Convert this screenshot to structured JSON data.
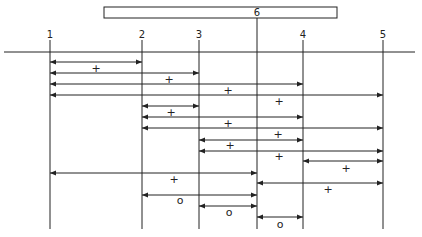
{
  "diagram": {
    "top_bar": {
      "label": "6",
      "x1": 104,
      "x2": 337,
      "y1": 7,
      "y2": 18
    },
    "baseline": {
      "y": 52,
      "x1": 4,
      "x2": 415
    },
    "stations": [
      {
        "label": "1",
        "x": 50
      },
      {
        "label": "2",
        "x": 142
      },
      {
        "label": "3",
        "x": 199
      },
      {
        "label": "4",
        "x": 303
      },
      {
        "label": "5",
        "x": 383
      },
      {
        "label": "6",
        "x": 257
      }
    ],
    "spans": [
      {
        "from": "1",
        "to": "2",
        "y": 62,
        "symbol": "+",
        "sx": 96,
        "sy": 68
      },
      {
        "from": "1",
        "to": "3",
        "y": 73,
        "symbol": "+",
        "sx": 169,
        "sy": 79
      },
      {
        "from": "1",
        "to": "4",
        "y": 84,
        "symbol": "+",
        "sx": 228,
        "sy": 90
      },
      {
        "from": "1",
        "to": "5",
        "y": 95,
        "symbol": "+",
        "sx": 279,
        "sy": 101
      },
      {
        "from": "2",
        "to": "3",
        "y": 106,
        "symbol": "+",
        "sx": 171,
        "sy": 112
      },
      {
        "from": "2",
        "to": "4",
        "y": 117,
        "symbol": "+",
        "sx": 228,
        "sy": 123
      },
      {
        "from": "2",
        "to": "5",
        "y": 128,
        "symbol": "+",
        "sx": 278,
        "sy": 134
      },
      {
        "from": "3",
        "to": "4",
        "y": 140,
        "symbol": "+",
        "sx": 230,
        "sy": 145
      },
      {
        "from": "3",
        "to": "5",
        "y": 151,
        "symbol": "+",
        "sx": 279,
        "sy": 156
      },
      {
        "from": "4",
        "to": "5",
        "y": 161,
        "symbol": "+",
        "sx": 346,
        "sy": 168
      },
      {
        "from": "1",
        "to": "6",
        "y": 173,
        "symbol": "+",
        "sx": 174,
        "sy": 179
      },
      {
        "from": "6",
        "to": "5",
        "y": 183,
        "symbol": "+",
        "sx": 328,
        "sy": 189
      },
      {
        "from": "2",
        "to": "6",
        "y": 195,
        "symbol": "o",
        "sx": 180,
        "sy": 200
      },
      {
        "from": "3",
        "to": "6",
        "y": 206,
        "symbol": "o",
        "sx": 229,
        "sy": 212
      },
      {
        "from": "6",
        "to": "4",
        "y": 217,
        "symbol": "o",
        "sx": 280,
        "sy": 224
      }
    ],
    "line_bottom": 229,
    "colors": {
      "ink": "#222222",
      "background": "#ffffff"
    }
  }
}
